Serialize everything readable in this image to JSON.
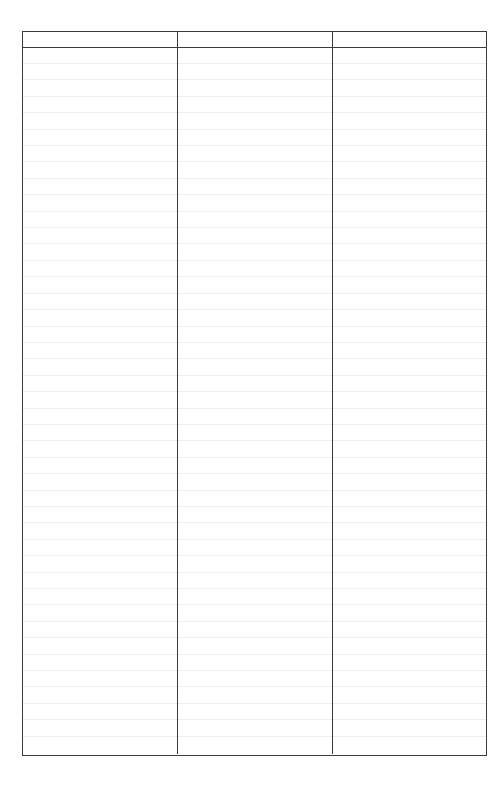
{
  "document": {
    "type": "blank-ruled-table",
    "background_color": "#ffffff",
    "page_width": 503,
    "page_height": 799
  },
  "table": {
    "border_color": "#3b3b3b",
    "rule_color": "#eeeeee",
    "left": 22,
    "top": 31,
    "width": 465,
    "height": 725,
    "column_count": 3,
    "body_row_count": 43,
    "header_row_height": 16,
    "body_row_height": 16.42,
    "column_widths": [
      154,
      155,
      156
    ],
    "headers": [
      "",
      "",
      ""
    ],
    "rows": [
      [
        "",
        "",
        ""
      ],
      [
        "",
        "",
        ""
      ],
      [
        "",
        "",
        ""
      ],
      [
        "",
        "",
        ""
      ],
      [
        "",
        "",
        ""
      ],
      [
        "",
        "",
        ""
      ],
      [
        "",
        "",
        ""
      ],
      [
        "",
        "",
        ""
      ],
      [
        "",
        "",
        ""
      ],
      [
        "",
        "",
        ""
      ],
      [
        "",
        "",
        ""
      ],
      [
        "",
        "",
        ""
      ],
      [
        "",
        "",
        ""
      ],
      [
        "",
        "",
        ""
      ],
      [
        "",
        "",
        ""
      ],
      [
        "",
        "",
        ""
      ],
      [
        "",
        "",
        ""
      ],
      [
        "",
        "",
        ""
      ],
      [
        "",
        "",
        ""
      ],
      [
        "",
        "",
        ""
      ],
      [
        "",
        "",
        ""
      ],
      [
        "",
        "",
        ""
      ],
      [
        "",
        "",
        ""
      ],
      [
        "",
        "",
        ""
      ],
      [
        "",
        "",
        ""
      ],
      [
        "",
        "",
        ""
      ],
      [
        "",
        "",
        ""
      ],
      [
        "",
        "",
        ""
      ],
      [
        "",
        "",
        ""
      ],
      [
        "",
        "",
        ""
      ],
      [
        "",
        "",
        ""
      ],
      [
        "",
        "",
        ""
      ],
      [
        "",
        "",
        ""
      ],
      [
        "",
        "",
        ""
      ],
      [
        "",
        "",
        ""
      ],
      [
        "",
        "",
        ""
      ],
      [
        "",
        "",
        ""
      ],
      [
        "",
        "",
        ""
      ],
      [
        "",
        "",
        ""
      ],
      [
        "",
        "",
        ""
      ],
      [
        "",
        "",
        ""
      ],
      [
        "",
        "",
        ""
      ],
      [
        "",
        "",
        ""
      ]
    ]
  }
}
